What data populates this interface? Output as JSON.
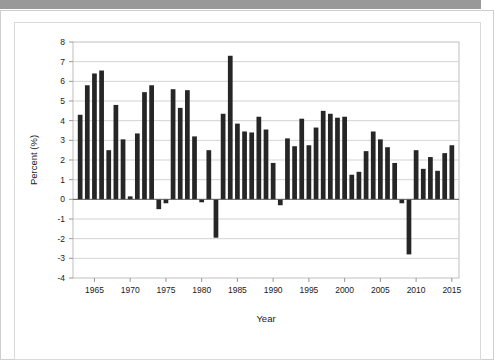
{
  "document": {
    "header_band_color": "#999999",
    "page_background": "#ffffff",
    "outer_border_color": "#cfcfcf",
    "figure_border_color": "#d9d9d9"
  },
  "chart_data": {
    "type": "bar",
    "title": "",
    "subtitle": "",
    "xlabel": "Year",
    "ylabel": "Percent (%)",
    "xlim": [
      1962,
      2016
    ],
    "ylim": [
      -4,
      8
    ],
    "ytick_labels": [
      "8",
      "7",
      "6",
      "5",
      "4",
      "3",
      "2",
      "1",
      "0",
      "-1",
      "-2",
      "-3",
      "-4"
    ],
    "ytick_values": [
      8,
      7,
      6,
      5,
      4,
      3,
      2,
      1,
      0,
      -1,
      -2,
      -3,
      -4
    ],
    "xtick_labels": [
      "1965",
      "1970",
      "1975",
      "1980",
      "1985",
      "1990",
      "1995",
      "2000",
      "2005",
      "2010",
      "2015"
    ],
    "xtick_values": [
      1965,
      1970,
      1975,
      1980,
      1985,
      1990,
      1995,
      2000,
      2005,
      2010,
      2015
    ],
    "grid": true,
    "grid_axis": "y",
    "legend": false,
    "legend_position": "none",
    "bar_color": "#262626",
    "categories": [
      1963,
      1964,
      1965,
      1966,
      1967,
      1968,
      1969,
      1970,
      1971,
      1972,
      1973,
      1974,
      1975,
      1976,
      1977,
      1978,
      1979,
      1980,
      1981,
      1982,
      1983,
      1984,
      1985,
      1986,
      1987,
      1988,
      1989,
      1990,
      1991,
      1992,
      1993,
      1994,
      1995,
      1996,
      1997,
      1998,
      1999,
      2000,
      2001,
      2002,
      2003,
      2004,
      2005,
      2006,
      2007,
      2008,
      2009,
      2010,
      2011,
      2012,
      2013,
      2014,
      2015
    ],
    "values": [
      4.3,
      5.8,
      6.4,
      6.55,
      2.5,
      4.8,
      3.05,
      0.15,
      3.35,
      5.45,
      5.8,
      -0.5,
      -0.2,
      5.6,
      4.65,
      5.55,
      3.2,
      -0.15,
      2.5,
      -1.95,
      4.35,
      7.3,
      3.85,
      3.45,
      3.4,
      4.2,
      3.55,
      1.85,
      -0.3,
      3.1,
      2.7,
      4.1,
      2.75,
      3.65,
      4.5,
      4.35,
      4.15,
      4.2,
      1.25,
      1.4,
      2.45,
      3.45,
      3.05,
      2.65,
      1.85,
      -0.2,
      -2.8,
      2.5,
      1.55,
      2.15,
      1.45,
      2.35,
      2.75
    ]
  },
  "axes": {
    "y_axis_title": "Percent (%)",
    "x_axis_title": "Year"
  }
}
